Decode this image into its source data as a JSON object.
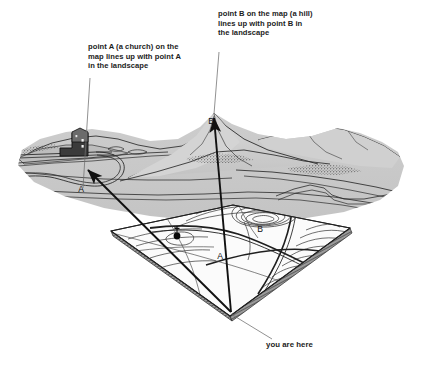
{
  "figure": {
    "background_color": "#ffffff",
    "terrain_fill": "#c9c9c9",
    "terrain_fill_light": "#d6d6d6",
    "terrain_fill_dark": "#b3b3b3",
    "map_fill": "#fbfbfb",
    "map_edge_fill": "#8f8f8f",
    "ink_color": "#1c1c1c",
    "leader_color": "#6e6e6e"
  },
  "annotations": {
    "point_a": "point A (a church) on the\nmap lines up with point A\nin the landscape",
    "point_b": "point B on the map (a hill)\nlines up with point B in\nthe landscape",
    "you_are_here": "you are here"
  },
  "labels": {
    "landscape_a": "A",
    "landscape_b": "B",
    "map_a": "A",
    "map_b": "B"
  },
  "features": {
    "church": "church-building",
    "hill": "hill-peak",
    "map_church_symbol": "church-dot-symbol",
    "sight_line_a": "sight-line-to-church",
    "sight_line_b": "sight-line-to-hill",
    "observer_point": "you-are-here-point"
  }
}
